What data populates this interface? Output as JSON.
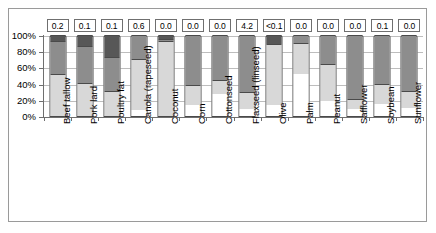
{
  "chart_data": {
    "type": "bar",
    "title": "",
    "subtitle": "",
    "xlabel": "",
    "ylabel": "",
    "ylim": [
      0,
      100
    ],
    "ytick_labels": [
      "0%",
      "20%",
      "40%",
      "60%",
      "80%",
      "100%"
    ],
    "ytick_values": [
      0,
      20,
      40,
      60,
      80,
      100
    ],
    "grid": true,
    "legend_position": "none",
    "stacked": true,
    "stack_order_bottom_to_top": [
      "segment-1",
      "segment-2",
      "segment-3",
      "segment-4"
    ],
    "series": [
      {
        "name": "segment-1",
        "color": "#ffffff",
        "values": [
          0,
          0,
          0,
          7,
          0,
          13,
          27,
          9,
          14,
          52,
          18,
          9,
          15,
          10
        ]
      },
      {
        "name": "segment-2",
        "color": "#d8d8d8",
        "values": [
          52,
          41,
          31,
          63,
          92,
          25,
          18,
          21,
          75,
          38,
          46,
          12,
          24,
          21
        ]
      },
      {
        "name": "segment-3",
        "color": "#8d8d8d",
        "values": [
          41,
          45,
          42,
          30,
          3,
          62,
          55,
          70,
          0,
          10,
          36,
          79,
          61,
          69
        ]
      },
      {
        "name": "segment-4",
        "color": "#575757",
        "values": [
          7,
          14,
          27,
          0,
          5,
          0,
          0,
          0,
          11,
          0,
          0,
          0,
          0,
          0
        ]
      }
    ],
    "categories": [
      "Beef tallow",
      "Pork lard",
      "Poultry fat",
      "Canola (rapeseed)",
      "Coconut",
      "Corn",
      "Cottonseed",
      "Flaxseed (linseed)",
      "Olive",
      "Palm",
      "Peanut",
      "Safflower",
      "Soybean",
      "Sunflower"
    ],
    "value_labels": [
      "0.2",
      "0.1",
      "0.1",
      "0.6",
      "0.0",
      "0.0",
      "0.0",
      "4.2",
      "<0.1",
      "0.0",
      "0.0",
      "0.0",
      "0.1",
      "0.0"
    ]
  },
  "colors": {
    "segment_1": "#ffffff",
    "segment_2": "#d8d8d8",
    "segment_3": "#8d8d8d",
    "segment_4": "#575757",
    "axis": "#6f6f6f",
    "grid": "#bdbdbd",
    "bar_outline": "#4a4a4a",
    "frame": "#9a9a9a",
    "background": "#ffffff"
  }
}
